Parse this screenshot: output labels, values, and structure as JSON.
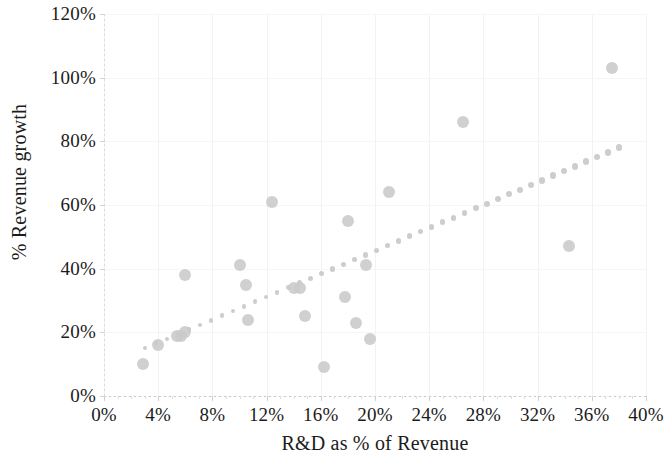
{
  "chart_data": {
    "type": "scatter",
    "title": "",
    "xlabel": "R&D as % of Revenue",
    "ylabel": "% Revenue growth",
    "xlim": [
      0,
      40
    ],
    "ylim": [
      0,
      120
    ],
    "x_tick_labels": [
      "0%",
      "4%",
      "8%",
      "12%",
      "16%",
      "20%",
      "24%",
      "28%",
      "32%",
      "36%",
      "40%"
    ],
    "x_ticks": [
      0,
      4,
      8,
      12,
      16,
      20,
      24,
      28,
      32,
      36,
      40
    ],
    "y_tick_labels": [
      "0%",
      "20%",
      "40%",
      "60%",
      "80%",
      "100%",
      "120%"
    ],
    "y_ticks": [
      0,
      20,
      40,
      60,
      80,
      100,
      120
    ],
    "grid": true,
    "legend": "none",
    "marker_color": "#c9c9c9",
    "trendline_color": "#cdcdcd",
    "series": [
      {
        "name": "Companies",
        "marker": "circle",
        "points": [
          {
            "x": 2.9,
            "y": 10
          },
          {
            "x": 4.0,
            "y": 16
          },
          {
            "x": 5.4,
            "y": 19
          },
          {
            "x": 5.7,
            "y": 19
          },
          {
            "x": 6.0,
            "y": 20
          },
          {
            "x": 6.0,
            "y": 38
          },
          {
            "x": 10.0,
            "y": 41
          },
          {
            "x": 10.5,
            "y": 35
          },
          {
            "x": 10.6,
            "y": 24
          },
          {
            "x": 12.4,
            "y": 61
          },
          {
            "x": 14.0,
            "y": 34
          },
          {
            "x": 14.5,
            "y": 34
          },
          {
            "x": 14.8,
            "y": 25
          },
          {
            "x": 16.2,
            "y": 9
          },
          {
            "x": 17.8,
            "y": 31
          },
          {
            "x": 18.0,
            "y": 55
          },
          {
            "x": 18.6,
            "y": 23
          },
          {
            "x": 19.3,
            "y": 41
          },
          {
            "x": 19.6,
            "y": 18
          },
          {
            "x": 21.0,
            "y": 64
          },
          {
            "x": 26.5,
            "y": 86
          },
          {
            "x": 34.3,
            "y": 47
          },
          {
            "x": 37.5,
            "y": 103
          }
        ]
      }
    ],
    "trendline": {
      "type": "dotted-linear",
      "x_start": 3.0,
      "y_start": 15.0,
      "x_end": 38.0,
      "y_end": 78.0,
      "dot_count": 44
    }
  }
}
